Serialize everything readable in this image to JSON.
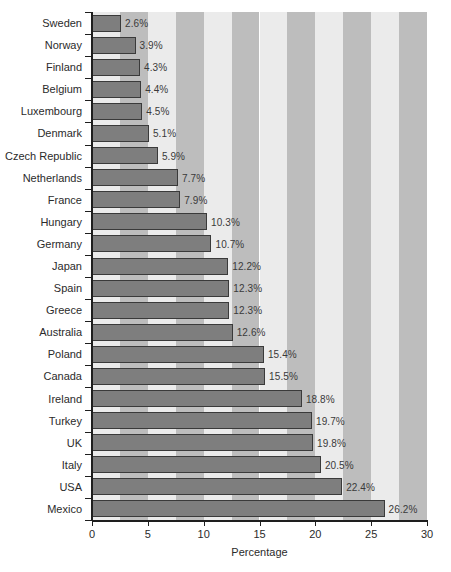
{
  "chart_data": {
    "type": "bar",
    "orientation": "horizontal",
    "title": "",
    "xlabel": "Percentage",
    "ylabel": "",
    "xlim": [
      0,
      30
    ],
    "xticks": [
      0,
      5,
      10,
      15,
      20,
      25,
      30
    ],
    "grid": false,
    "legend": null,
    "background_bands": {
      "period": 5,
      "band_width": 2.5,
      "light_color": "#ebebeb",
      "dark_color": "#bdbdbd"
    },
    "bar_color": "#7e7e7e",
    "bar_edge_color": "#3a3a3a",
    "value_label_suffix": "%",
    "categories": [
      "Sweden",
      "Norway",
      "Finland",
      "Belgium",
      "Luxembourg",
      "Denmark",
      "Czech Republic",
      "Netherlands",
      "France",
      "Hungary",
      "Germany",
      "Japan",
      "Spain",
      "Greece",
      "Australia",
      "Poland",
      "Canada",
      "Ireland",
      "Turkey",
      "UK",
      "Italy",
      "USA",
      "Mexico"
    ],
    "values": [
      2.6,
      3.9,
      4.3,
      4.4,
      4.5,
      5.1,
      5.9,
      7.7,
      7.9,
      10.3,
      10.7,
      12.2,
      12.3,
      12.3,
      12.6,
      15.4,
      15.5,
      18.8,
      19.7,
      19.8,
      20.5,
      22.4,
      26.2
    ],
    "value_labels": [
      "2.6%",
      "3.9%",
      "4.3%",
      "4.4%",
      "4.5%",
      "5.1%",
      "5.9%",
      "7.7%",
      "7.9%",
      "10.3%",
      "10.7%",
      "12.2%",
      "12.3%",
      "12.3%",
      "12.6%",
      "15.4%",
      "15.5%",
      "18.8%",
      "19.7%",
      "19.8%",
      "20.5%",
      "22.4%",
      "26.2%"
    ],
    "xtick_labels": [
      "0",
      "5",
      "10",
      "15",
      "20",
      "25",
      "30"
    ]
  }
}
